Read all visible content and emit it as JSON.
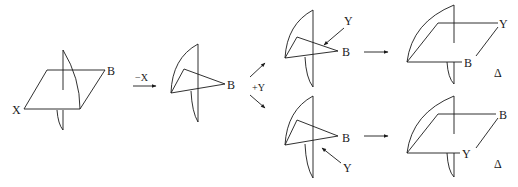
{
  "diagram": {
    "colors": {
      "stroke": "#1a1a1a",
      "background": "#ffffff"
    },
    "figure1": {
      "labels": {
        "left": "X",
        "right": "B"
      }
    },
    "step1": {
      "operation": "−X"
    },
    "figure2": {
      "labels": {
        "right": "B"
      }
    },
    "step2": {
      "operation": "+Y"
    },
    "figure3_top": {
      "labels": {
        "right": "B",
        "arrow_label": "Y"
      }
    },
    "figure3_bottom": {
      "labels": {
        "right": "B",
        "arrow_label": "Y"
      }
    },
    "figure4_top": {
      "labels": {
        "top_right": "Y",
        "bottom": "B",
        "result": "Δ"
      }
    },
    "figure4_bottom": {
      "labels": {
        "top_right": "B",
        "bottom": "Y",
        "result": "Δ"
      }
    }
  }
}
